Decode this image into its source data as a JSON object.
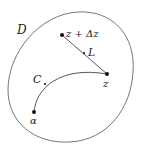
{
  "diagram": {
    "region_label": "D",
    "points": {
      "z_plus_dz": {
        "label": "z + Δz",
        "x": 62,
        "y": 35
      },
      "mid_L": {
        "label": "L",
        "x": 84,
        "y": 53
      },
      "z": {
        "label": "z",
        "x": 107,
        "y": 74
      },
      "mid_C": {
        "label": "C",
        "x": 45,
        "y": 84
      },
      "alpha": {
        "label": "α",
        "x": 34,
        "y": 112
      }
    },
    "segments": [
      {
        "name": "L",
        "from": "z_plus_dz",
        "to": "z",
        "type": "line"
      },
      {
        "name": "C",
        "from": "alpha",
        "to": "z",
        "type": "curve"
      }
    ],
    "colors": {
      "stroke": "#555555",
      "point": "#111111",
      "text": "#222222"
    }
  }
}
